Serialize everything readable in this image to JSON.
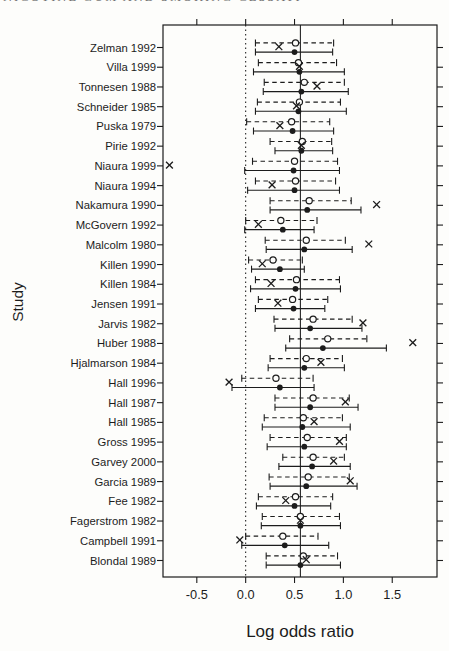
{
  "header": {
    "running_title": "NICOTINE GUM AND SMOKING CESSATION"
  },
  "colors": {
    "ink": "#1c1c1c",
    "paper": "#fdfdfb",
    "header_gray": "#6d6d6d"
  },
  "chart_data": {
    "type": "forest",
    "title": "",
    "xlabel": "Log odds ratio",
    "ylabel": "Study",
    "xlim": [
      -0.846,
      1.958
    ],
    "x_tick_values": [
      -0.5,
      0.0,
      0.5,
      1.0,
      1.5
    ],
    "x_tick_labels": [
      "-0.5",
      "0.0",
      "0.5",
      "1.0",
      "1.5"
    ],
    "grid": false,
    "legend": "none",
    "markers": {
      "solid_interval": "filled-circle",
      "dashed_interval": "open-circle",
      "extra_estimate": "x-cross"
    },
    "reference_lines": [
      {
        "x": 0.0,
        "style": "dotted"
      },
      {
        "x": 0.56,
        "style": "solid"
      }
    ],
    "studies": [
      {
        "label": "Zelman 1992",
        "dashed": {
          "lo": 0.1,
          "est": 0.51,
          "hi": 0.9
        },
        "solid": {
          "lo": 0.1,
          "est": 0.5,
          "hi": 0.89
        },
        "x_mark": 0.34
      },
      {
        "label": "Villa 1999",
        "dashed": {
          "lo": 0.13,
          "est": 0.54,
          "hi": 0.93
        },
        "solid": {
          "lo": 0.08,
          "est": 0.55,
          "hi": 1.01
        },
        "x_mark": 0.55
      },
      {
        "label": "Tonnesen 1988",
        "dashed": {
          "lo": 0.19,
          "est": 0.6,
          "hi": 1.01
        },
        "solid": {
          "lo": 0.18,
          "est": 0.57,
          "hi": 1.05
        },
        "x_mark": 0.73
      },
      {
        "label": "Schneider 1985",
        "dashed": {
          "lo": 0.12,
          "est": 0.55,
          "hi": 0.97
        },
        "solid": {
          "lo": 0.1,
          "est": 0.54,
          "hi": 1.03
        },
        "x_mark": 0.52
      },
      {
        "label": "Puska 1979",
        "dashed": {
          "lo": 0.01,
          "est": 0.47,
          "hi": 0.86
        },
        "solid": {
          "lo": 0.08,
          "est": 0.48,
          "hi": 0.9
        },
        "x_mark": 0.35
      },
      {
        "label": "Pirie 1992",
        "dashed": {
          "lo": 0.25,
          "est": 0.58,
          "hi": 0.88
        },
        "solid": {
          "lo": 0.3,
          "est": 0.57,
          "hi": 0.89
        },
        "x_mark": 0.57
      },
      {
        "label": "Niaura 1999",
        "dashed": {
          "lo": 0.07,
          "est": 0.5,
          "hi": 0.94
        },
        "solid": {
          "lo": -0.01,
          "est": 0.49,
          "hi": 0.96
        },
        "x_mark": -0.78
      },
      {
        "label": "Niaura 1994",
        "dashed": {
          "lo": 0.1,
          "est": 0.51,
          "hi": 0.92
        },
        "solid": {
          "lo": 0.02,
          "est": 0.5,
          "hi": 0.96
        },
        "x_mark": 0.27
      },
      {
        "label": "Nakamura 1990",
        "dashed": {
          "lo": 0.25,
          "est": 0.65,
          "hi": 1.08
        },
        "solid": {
          "lo": 0.25,
          "est": 0.63,
          "hi": 1.18
        },
        "x_mark": 1.34
      },
      {
        "label": "McGovern 1992",
        "dashed": {
          "lo": 0.0,
          "est": 0.36,
          "hi": 0.73
        },
        "solid": {
          "lo": -0.01,
          "est": 0.38,
          "hi": 0.7
        },
        "x_mark": 0.13
      },
      {
        "label": "Malcolm 1980",
        "dashed": {
          "lo": 0.2,
          "est": 0.62,
          "hi": 1.02
        },
        "solid": {
          "lo": 0.21,
          "est": 0.6,
          "hi": 1.09
        },
        "x_mark": 1.26
      },
      {
        "label": "Killen 1990",
        "dashed": {
          "lo": 0.03,
          "est": 0.28,
          "hi": 0.58
        },
        "solid": {
          "lo": 0.06,
          "est": 0.35,
          "hi": 0.6
        },
        "x_mark": 0.17
      },
      {
        "label": "Killen 1984",
        "dashed": {
          "lo": 0.1,
          "est": 0.52,
          "hi": 0.96
        },
        "solid": {
          "lo": 0.05,
          "est": 0.51,
          "hi": 0.97
        },
        "x_mark": 0.26
      },
      {
        "label": "Jensen 1991",
        "dashed": {
          "lo": 0.13,
          "est": 0.48,
          "hi": 0.84
        },
        "solid": {
          "lo": 0.1,
          "est": 0.49,
          "hi": 0.81
        },
        "x_mark": 0.33
      },
      {
        "label": "Jarvis 1982",
        "dashed": {
          "lo": 0.29,
          "est": 0.69,
          "hi": 1.09
        },
        "solid": {
          "lo": 0.3,
          "est": 0.66,
          "hi": 1.19
        },
        "x_mark": 1.2
      },
      {
        "label": "Huber 1988",
        "dashed": {
          "lo": 0.45,
          "est": 0.84,
          "hi": 1.24
        },
        "solid": {
          "lo": 0.41,
          "est": 0.79,
          "hi": 1.44
        },
        "x_mark": 1.71
      },
      {
        "label": "Hjalmarson 1984",
        "dashed": {
          "lo": 0.25,
          "est": 0.62,
          "hi": 0.99
        },
        "solid": {
          "lo": 0.23,
          "est": 0.6,
          "hi": 1.01
        },
        "x_mark": 0.77
      },
      {
        "label": "Hall 1996",
        "dashed": {
          "lo": -0.04,
          "est": 0.31,
          "hi": 0.69
        },
        "solid": {
          "lo": -0.14,
          "est": 0.35,
          "hi": 0.7
        },
        "x_mark": -0.17
      },
      {
        "label": "Hall 1987",
        "dashed": {
          "lo": 0.3,
          "est": 0.69,
          "hi": 1.06
        },
        "solid": {
          "lo": 0.3,
          "est": 0.66,
          "hi": 1.15
        },
        "x_mark": 1.02
      },
      {
        "label": "Hall 1985",
        "dashed": {
          "lo": 0.19,
          "est": 0.59,
          "hi": 0.99
        },
        "solid": {
          "lo": 0.17,
          "est": 0.58,
          "hi": 1.07
        },
        "x_mark": 0.7
      },
      {
        "label": "Gross 1995",
        "dashed": {
          "lo": 0.25,
          "est": 0.63,
          "hi": 1.03
        },
        "solid": {
          "lo": 0.22,
          "est": 0.6,
          "hi": 1.03
        },
        "x_mark": 0.96
      },
      {
        "label": "Garvey 2000",
        "dashed": {
          "lo": 0.38,
          "est": 0.69,
          "hi": 1.01
        },
        "solid": {
          "lo": 0.34,
          "est": 0.68,
          "hi": 1.07
        },
        "x_mark": 0.9
      },
      {
        "label": "Garcia 1989",
        "dashed": {
          "lo": 0.24,
          "est": 0.64,
          "hi": 1.06
        },
        "solid": {
          "lo": 0.25,
          "est": 0.62,
          "hi": 1.14
        },
        "x_mark": 1.07
      },
      {
        "label": "Fee 1982",
        "dashed": {
          "lo": 0.13,
          "est": 0.51,
          "hi": 0.89
        },
        "solid": {
          "lo": 0.11,
          "est": 0.5,
          "hi": 0.87
        },
        "x_mark": 0.41
      },
      {
        "label": "Fagerstrom 1982",
        "dashed": {
          "lo": 0.17,
          "est": 0.56,
          "hi": 0.96
        },
        "solid": {
          "lo": 0.16,
          "est": 0.56,
          "hi": 0.97
        },
        "x_mark": 0.56
      },
      {
        "label": "Campbell 1991",
        "dashed": {
          "lo": 0.0,
          "est": 0.38,
          "hi": 0.74
        },
        "solid": {
          "lo": -0.04,
          "est": 0.4,
          "hi": 0.85
        },
        "x_mark": -0.06
      },
      {
        "label": "Blondal 1989",
        "dashed": {
          "lo": 0.21,
          "est": 0.59,
          "hi": 0.94
        },
        "solid": {
          "lo": 0.21,
          "est": 0.56,
          "hi": 0.97
        },
        "x_mark": 0.62
      }
    ]
  }
}
